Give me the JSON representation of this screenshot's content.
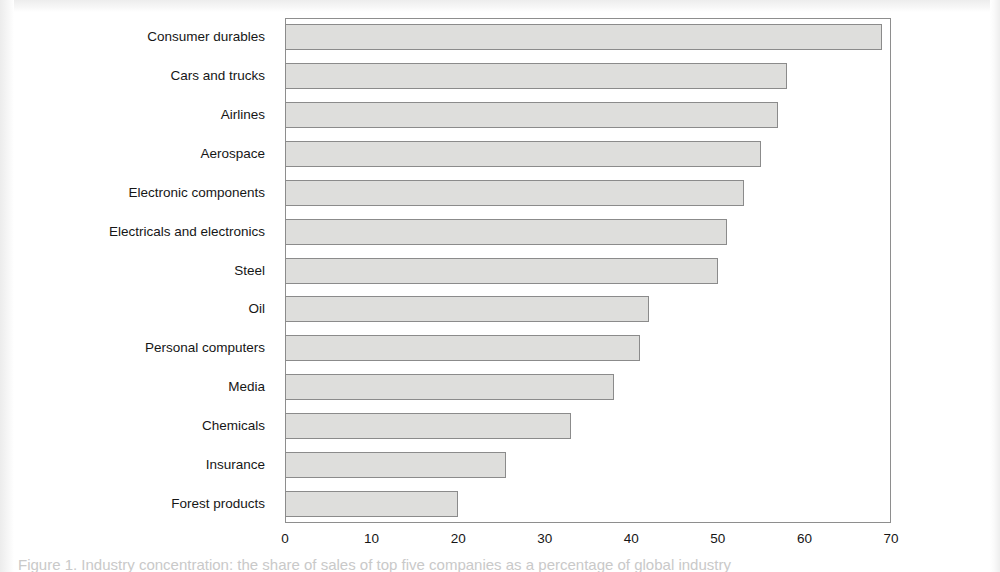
{
  "figure": {
    "caption": "Figure 1. Industry concentration: the share of sales of top five companies as a percentage of global industry"
  },
  "chart_data": {
    "type": "bar",
    "orientation": "horizontal",
    "title": "",
    "subtitle": "",
    "xlabel": "",
    "ylabel": "",
    "xlim": [
      0,
      70
    ],
    "ylim": null,
    "grid": false,
    "legend": null,
    "bar_color": "#dededc",
    "bar_edge_color": "#8b8b8b",
    "frame_color": "#8e8e8e",
    "xticks": [
      0,
      10,
      20,
      30,
      40,
      50,
      60,
      70
    ],
    "xtick_labels": [
      "0",
      "10",
      "20",
      "30",
      "40",
      "50",
      "60",
      "70"
    ],
    "categories": [
      "Consumer durables",
      "Cars and trucks",
      "Airlines",
      "Aerospace",
      "Electronic components",
      "Electricals and electronics",
      "Steel",
      "Oil",
      "Personal computers",
      "Media",
      "Chemicals",
      "Insurance",
      "Forest products"
    ],
    "values": [
      69,
      58,
      57,
      55,
      53,
      51,
      50,
      42,
      41,
      38,
      33,
      25.5,
      20
    ]
  }
}
